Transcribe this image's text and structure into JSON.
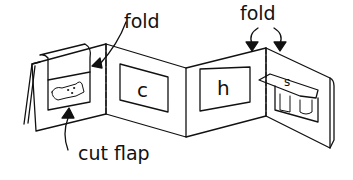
{
  "labels": {
    "fold_left": "fold",
    "fold_right": "fold",
    "cut_flap": "cut flap"
  },
  "panels": {
    "panel_1_picture": "dog",
    "panel_2_letter": "c",
    "panel_3_letter": "h",
    "panel_4_flap_letter": "s",
    "panel_4_picture": "sock"
  },
  "colors": {
    "line": "#111111",
    "background": "#ffffff"
  }
}
